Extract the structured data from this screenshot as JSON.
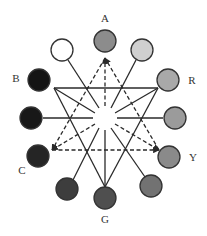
{
  "diagram": {
    "center": {
      "x": 105,
      "y": 118
    },
    "hole_radius": 11,
    "node_radius": 11,
    "labels": {
      "A": "A",
      "B": "B",
      "C": "C",
      "R": "R",
      "Y": "Y",
      "G": "G"
    },
    "nodes": [
      {
        "id": "A",
        "label": "A",
        "x": 105,
        "y": 41,
        "fill": "#8c8c8c",
        "label_x": 105,
        "label_y": 22
      },
      {
        "id": "n1",
        "label": "",
        "x": 142,
        "y": 50,
        "fill": "#cfcfcf"
      },
      {
        "id": "R",
        "label": "R",
        "x": 168,
        "y": 80,
        "fill": "#a9a9a9",
        "label_x": 192,
        "label_y": 84
      },
      {
        "id": "n3",
        "label": "",
        "x": 175,
        "y": 118,
        "fill": "#9b9b9b"
      },
      {
        "id": "Y",
        "label": "Y",
        "x": 169,
        "y": 157,
        "fill": "#8a8a8a",
        "label_x": 193,
        "label_y": 161
      },
      {
        "id": "n5",
        "label": "",
        "x": 151,
        "y": 186,
        "fill": "#727272"
      },
      {
        "id": "G",
        "label": "G",
        "x": 105,
        "y": 198,
        "fill": "#4f4f4f",
        "label_x": 105,
        "label_y": 223
      },
      {
        "id": "n7",
        "label": "",
        "x": 67,
        "y": 189,
        "fill": "#3d3d3d"
      },
      {
        "id": "C",
        "label": "C",
        "x": 38,
        "y": 156,
        "fill": "#252525",
        "label_x": 22,
        "label_y": 174
      },
      {
        "id": "n9",
        "label": "",
        "x": 31,
        "y": 118,
        "fill": "#181818"
      },
      {
        "id": "B",
        "label": "B",
        "x": 39,
        "y": 80,
        "fill": "#141414",
        "label_x": 16,
        "label_y": 82
      },
      {
        "id": "n11",
        "label": "",
        "x": 62,
        "y": 50,
        "fill": "#ffffff"
      }
    ],
    "solid_triangle": {
      "style": "solid",
      "vertices": [
        [
          54,
          88
        ],
        [
          158,
          88
        ],
        [
          105,
          187
        ]
      ],
      "arrowheads": false
    },
    "dashed_triangle": {
      "style": "dashed",
      "vertices": [
        [
          105,
          58
        ],
        [
          52,
          150
        ],
        [
          159,
          150
        ]
      ],
      "arrowheads": true
    },
    "solid_to_center": [
      {
        "from": [
          54,
          88
        ],
        "to": [
          95,
          113
        ]
      },
      {
        "from": [
          158,
          88
        ],
        "to": [
          115,
          113
        ]
      },
      {
        "from": [
          105,
          187
        ],
        "to": [
          105,
          130
        ]
      }
    ],
    "dashed_to_center": [
      {
        "from": [
          105,
          58
        ],
        "to": [
          105,
          106
        ]
      },
      {
        "from": [
          52,
          150
        ],
        "to": [
          95,
          124
        ]
      },
      {
        "from": [
          159,
          150
        ],
        "to": [
          115,
          124
        ]
      }
    ],
    "spokes": [
      {
        "from": [
          68,
          60
        ],
        "to": [
          99,
          108
        ]
      },
      {
        "from": [
          136,
          60
        ],
        "to": [
          111,
          108
        ]
      },
      {
        "from": [
          43,
          118
        ],
        "to": [
          93,
          118
        ]
      },
      {
        "from": [
          163,
          118
        ],
        "to": [
          117,
          118
        ]
      },
      {
        "from": [
          73,
          180
        ],
        "to": [
          99,
          128
        ]
      },
      {
        "from": [
          145,
          177
        ],
        "to": [
          111,
          128
        ]
      }
    ],
    "colors": {
      "line": "#2a2a2a",
      "outline": "#333333",
      "background": "#ffffff"
    }
  }
}
